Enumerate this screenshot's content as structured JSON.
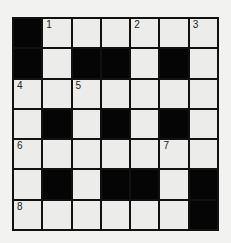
{
  "puzzle": {
    "rows": 7,
    "cols": 7,
    "colors": {
      "black": "#050505",
      "white": "#ececea",
      "line": "#111111",
      "background": "#f2f2f0"
    },
    "grid": [
      [
        "B",
        "W",
        "W",
        "W",
        "W",
        "W",
        "W"
      ],
      [
        "B",
        "W",
        "B",
        "B",
        "W",
        "B",
        "W"
      ],
      [
        "W",
        "W",
        "W",
        "W",
        "W",
        "W",
        "W"
      ],
      [
        "W",
        "B",
        "W",
        "B",
        "W",
        "B",
        "W"
      ],
      [
        "W",
        "W",
        "W",
        "W",
        "W",
        "W",
        "W"
      ],
      [
        "W",
        "B",
        "W",
        "B",
        "B",
        "W",
        "B"
      ],
      [
        "W",
        "W",
        "W",
        "W",
        "W",
        "W",
        "B"
      ]
    ],
    "numbers": {
      "0-1": "1",
      "0-4": "2",
      "0-6": "3",
      "2-0": "4",
      "2-2": "5",
      "4-0": "6",
      "4-5": "7",
      "6-0": "8"
    }
  }
}
